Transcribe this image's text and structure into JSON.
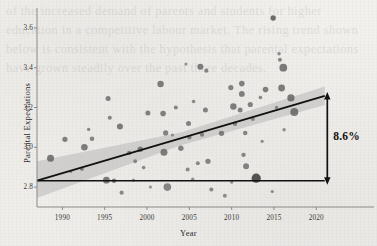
{
  "figure": {
    "background_color": "#f1efec",
    "ghost_text": "of the increased demand of parents and students for higher education in a competitive labour market. The rising trend shown below is consistent with the hypothesis that parental expectations have grown steadily over the past three decades.",
    "annotation": {
      "label": "8.6%",
      "arrow": "double-headed-vertical-arrow",
      "color": "#14110f"
    }
  },
  "chart_data": {
    "type": "scatter",
    "title": "",
    "xlabel": "Year",
    "ylabel": "Parental Expectations",
    "xlim": [
      1987.0,
      2021.5
    ],
    "ylim": [
      2.7,
      3.7
    ],
    "xticks": [
      1990,
      1995,
      2000,
      2005,
      2010,
      2015,
      2020
    ],
    "xticklabels": [
      "1990",
      "1995",
      "2000",
      "2005",
      "2010",
      "2015",
      "2020"
    ],
    "yticks": [
      2.8,
      3.0,
      3.2,
      3.4,
      3.6
    ],
    "yticklabels": [
      "2.8",
      "3.0",
      "3.2",
      "3.4",
      "3.6"
    ],
    "grid": false,
    "legend": null,
    "marker_color": "#6e6e6e",
    "marker_color_dark": "#3c3c3c",
    "regression_line": {
      "color": "#111111",
      "x": [
        1987.0,
        2021.0
      ],
      "y": [
        2.832,
        3.258
      ]
    },
    "confidence_band": {
      "color": "#b8b8b8",
      "opacity": 0.55,
      "x": [
        1987.0,
        2004.0,
        2021.0
      ],
      "y_lower": [
        2.745,
        3.01,
        3.212
      ],
      "y_upper": [
        2.93,
        3.075,
        3.305
      ]
    },
    "reference_line": {
      "color": "#111111",
      "y": 2.832,
      "x_start": 1987.0,
      "x_end": 2021.0
    },
    "annotation_arrow": {
      "x": 2021.3,
      "y_bottom": 2.832,
      "y_top": 3.258,
      "text": "8.6%"
    },
    "points": [
      {
        "x": 1988.6,
        "y": 2.945,
        "size": 7.0,
        "shade": 0.62
      },
      {
        "x": 1990.3,
        "y": 3.04,
        "size": 5.2,
        "shade": 0.58
      },
      {
        "x": 1992.6,
        "y": 3.0,
        "size": 6.6,
        "shade": 0.6
      },
      {
        "x": 1992.3,
        "y": 2.892,
        "size": 4.2,
        "shade": 0.55
      },
      {
        "x": 1993.5,
        "y": 3.043,
        "size": 4.6,
        "shade": 0.55
      },
      {
        "x": 1993.1,
        "y": 3.09,
        "size": 3.4,
        "shade": 0.52
      },
      {
        "x": 1995.4,
        "y": 3.245,
        "size": 5.0,
        "shade": 0.58
      },
      {
        "x": 1995.2,
        "y": 2.835,
        "size": 6.8,
        "shade": 0.62
      },
      {
        "x": 1996.1,
        "y": 2.832,
        "size": 4.4,
        "shade": 0.58
      },
      {
        "x": 1995.6,
        "y": 3.148,
        "size": 4.0,
        "shade": 0.55
      },
      {
        "x": 1996.8,
        "y": 3.105,
        "size": 6.0,
        "shade": 0.6
      },
      {
        "x": 1997.0,
        "y": 2.772,
        "size": 4.2,
        "shade": 0.52
      },
      {
        "x": 1997.9,
        "y": 2.972,
        "size": 4.4,
        "shade": 0.56
      },
      {
        "x": 1998.6,
        "y": 2.93,
        "size": 3.8,
        "shade": 0.52
      },
      {
        "x": 1998.4,
        "y": 2.835,
        "size": 3.2,
        "shade": 0.5
      },
      {
        "x": 1999.2,
        "y": 2.99,
        "size": 5.4,
        "shade": 0.58
      },
      {
        "x": 1999.6,
        "y": 2.898,
        "size": 3.6,
        "shade": 0.52
      },
      {
        "x": 2000.1,
        "y": 3.172,
        "size": 5.0,
        "shade": 0.58
      },
      {
        "x": 2000.4,
        "y": 2.8,
        "size": 3.0,
        "shade": 0.48
      },
      {
        "x": 2001.6,
        "y": 3.318,
        "size": 6.4,
        "shade": 0.6
      },
      {
        "x": 2001.9,
        "y": 3.17,
        "size": 5.6,
        "shade": 0.58
      },
      {
        "x": 2002.2,
        "y": 3.072,
        "size": 5.2,
        "shade": 0.56
      },
      {
        "x": 2002.0,
        "y": 2.975,
        "size": 7.0,
        "shade": 0.6
      },
      {
        "x": 2002.4,
        "y": 2.8,
        "size": 7.6,
        "shade": 0.55
      },
      {
        "x": 2003.4,
        "y": 3.2,
        "size": 4.0,
        "shade": 0.54
      },
      {
        "x": 2004.0,
        "y": 2.995,
        "size": 5.4,
        "shade": 0.56
      },
      {
        "x": 2004.6,
        "y": 3.418,
        "size": 3.0,
        "shade": 0.5
      },
      {
        "x": 2004.9,
        "y": 3.12,
        "size": 5.0,
        "shade": 0.56
      },
      {
        "x": 2005.0,
        "y": 3.05,
        "size": 4.4,
        "shade": 0.54
      },
      {
        "x": 2004.8,
        "y": 2.888,
        "size": 4.0,
        "shade": 0.52
      },
      {
        "x": 2005.5,
        "y": 3.23,
        "size": 3.6,
        "shade": 0.52
      },
      {
        "x": 2005.4,
        "y": 2.84,
        "size": 3.2,
        "shade": 0.5
      },
      {
        "x": 2006.3,
        "y": 3.405,
        "size": 6.0,
        "shade": 0.6
      },
      {
        "x": 2006.5,
        "y": 3.063,
        "size": 4.2,
        "shade": 0.54
      },
      {
        "x": 2006.0,
        "y": 2.92,
        "size": 4.0,
        "shade": 0.52
      },
      {
        "x": 2007.0,
        "y": 3.385,
        "size": 4.2,
        "shade": 0.54
      },
      {
        "x": 2006.9,
        "y": 3.188,
        "size": 5.0,
        "shade": 0.56
      },
      {
        "x": 2007.2,
        "y": 2.93,
        "size": 5.2,
        "shade": 0.56
      },
      {
        "x": 2007.6,
        "y": 2.788,
        "size": 4.2,
        "shade": 0.52
      },
      {
        "x": 2008.8,
        "y": 3.07,
        "size": 5.4,
        "shade": 0.56
      },
      {
        "x": 2009.2,
        "y": 2.757,
        "size": 4.0,
        "shade": 0.5
      },
      {
        "x": 2009.9,
        "y": 3.3,
        "size": 5.2,
        "shade": 0.56
      },
      {
        "x": 2010.2,
        "y": 3.205,
        "size": 6.4,
        "shade": 0.6
      },
      {
        "x": 2010.4,
        "y": 3.118,
        "size": 4.4,
        "shade": 0.54
      },
      {
        "x": 2010.0,
        "y": 2.825,
        "size": 3.0,
        "shade": 0.48
      },
      {
        "x": 2011.2,
        "y": 3.32,
        "size": 5.6,
        "shade": 0.58
      },
      {
        "x": 2011.2,
        "y": 3.268,
        "size": 5.8,
        "shade": 0.58
      },
      {
        "x": 2011.0,
        "y": 3.188,
        "size": 5.0,
        "shade": 0.56
      },
      {
        "x": 2011.6,
        "y": 3.072,
        "size": 4.6,
        "shade": 0.54
      },
      {
        "x": 2011.4,
        "y": 2.962,
        "size": 4.4,
        "shade": 0.54
      },
      {
        "x": 2011.7,
        "y": 2.905,
        "size": 6.0,
        "shade": 0.56
      },
      {
        "x": 2012.2,
        "y": 3.215,
        "size": 5.2,
        "shade": 0.56
      },
      {
        "x": 2012.5,
        "y": 3.142,
        "size": 4.0,
        "shade": 0.52
      },
      {
        "x": 2012.9,
        "y": 2.845,
        "size": 9.2,
        "shade": 0.85
      },
      {
        "x": 2013.4,
        "y": 3.25,
        "size": 3.6,
        "shade": 0.52
      },
      {
        "x": 2014.0,
        "y": 3.29,
        "size": 5.6,
        "shade": 0.58
      },
      {
        "x": 2014.9,
        "y": 3.65,
        "size": 5.4,
        "shade": 0.7
      },
      {
        "x": 2014.8,
        "y": 2.778,
        "size": 3.2,
        "shade": 0.5
      },
      {
        "x": 2015.6,
        "y": 3.47,
        "size": 3.4,
        "shade": 0.52
      },
      {
        "x": 2015.7,
        "y": 3.44,
        "size": 4.0,
        "shade": 0.54
      },
      {
        "x": 2015.9,
        "y": 3.298,
        "size": 6.8,
        "shade": 0.6
      },
      {
        "x": 2015.3,
        "y": 3.2,
        "size": 3.4,
        "shade": 0.5
      },
      {
        "x": 2016.1,
        "y": 3.4,
        "size": 7.8,
        "shade": 0.62
      },
      {
        "x": 2016.2,
        "y": 3.088,
        "size": 3.4,
        "shade": 0.5
      },
      {
        "x": 2017.0,
        "y": 3.248,
        "size": 7.2,
        "shade": 0.62
      },
      {
        "x": 2017.4,
        "y": 3.178,
        "size": 8.0,
        "shade": 0.62
      },
      {
        "x": 2013.6,
        "y": 3.03,
        "size": 3.2,
        "shade": 0.5
      },
      {
        "x": 2003.0,
        "y": 3.062,
        "size": 3.0,
        "shade": 0.48
      },
      {
        "x": 1991.0,
        "y": 2.878,
        "size": 3.0,
        "shade": 0.48
      }
    ]
  }
}
